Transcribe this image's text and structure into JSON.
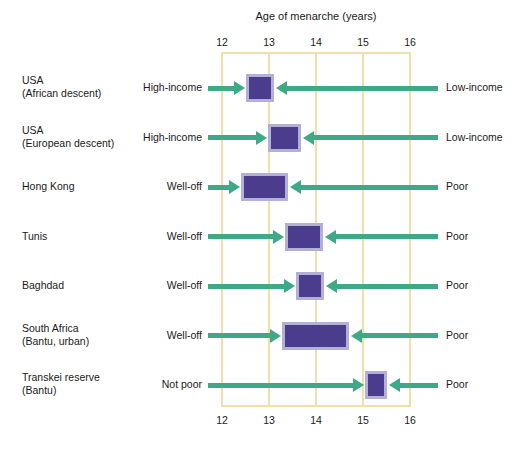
{
  "chart_data": {
    "type": "bar",
    "title": "Age of menarche (years)",
    "xlabel": "Age of menarche (years)",
    "ylabel": "",
    "xlim": [
      12,
      16
    ],
    "xticks": [
      12,
      13,
      14,
      15,
      16
    ],
    "xticklabels": [
      "12",
      "13",
      "14",
      "15",
      "16"
    ],
    "ticks_on_top": true,
    "ticks_on_bottom": true,
    "grid": true,
    "legend": "none",
    "orientation": "horizontal",
    "grid_color": "#efdfa8",
    "box_fill_color": "#4c3c8d",
    "box_edge_color": "#b3b0d6",
    "arrow_color": "#3fa886",
    "categories": [
      "USA (African descent)",
      "USA (European descent)",
      "Hong Kong",
      "Tunis",
      "Baghdad",
      "South Africa (Bantu, urban)",
      "Transkei reserve (Bantu)"
    ],
    "rows": [
      {
        "group_line1": "USA",
        "group_line2": "(African descent)",
        "left_label": "High-income",
        "right_label": "Low-income",
        "range_start": 12.5,
        "range_end": 13.1
      },
      {
        "group_line1": "USA",
        "group_line2": "(European descent)",
        "left_label": "High-income",
        "right_label": "Low-income",
        "range_start": 12.97,
        "range_end": 13.68
      },
      {
        "group_line1": "Hong Kong",
        "group_line2": "",
        "left_label": "Well-off",
        "right_label": "Poor",
        "range_start": 12.4,
        "range_end": 13.4
      },
      {
        "group_line1": "Tunis",
        "group_line2": "",
        "left_label": "Well-off",
        "right_label": "Poor",
        "range_start": 13.33,
        "range_end": 14.15
      },
      {
        "group_line1": "Baghdad",
        "group_line2": "",
        "left_label": "Well-off",
        "right_label": "Poor",
        "range_start": 13.58,
        "range_end": 14.18
      },
      {
        "group_line1": "South Africa",
        "group_line2": "(Bantu, urban)",
        "left_label": "Well-off",
        "right_label": "Poor",
        "range_start": 13.27,
        "range_end": 14.7
      },
      {
        "group_line1": "Transkei reserve",
        "group_line2": "(Bantu)",
        "left_label": "Not poor",
        "right_label": "Poor",
        "range_start": 15.05,
        "range_end": 15.52
      }
    ]
  }
}
